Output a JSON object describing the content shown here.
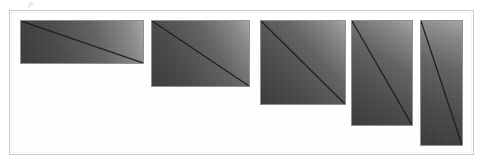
{
  "figure": {
    "background_color": "#ffffff",
    "frame": {
      "border_color": "#c9c9c9",
      "inner_border_color": "#f2f2f2",
      "x": 9,
      "y": 10,
      "width": 465,
      "height": 145
    },
    "artifact": {
      "name": "scan-speck",
      "x": 27,
      "y": 2
    }
  },
  "chart_data": {
    "type": "bar",
    "title": "",
    "subtitle": "",
    "xlabel": "",
    "ylabel": "",
    "grid": false,
    "legend": null,
    "annotations": [],
    "categories": [
      "plate-1",
      "plate-2",
      "plate-3",
      "plate-4",
      "plate-5"
    ],
    "values": [
      44,
      67,
      85,
      106,
      126
    ],
    "series": [
      {
        "name": "width",
        "values": [
          124,
          99,
          86,
          62,
          43
        ]
      },
      {
        "name": "height",
        "values": [
          44,
          67,
          85,
          106,
          126
        ]
      },
      {
        "name": "aspect_ratio_w_over_h",
        "values": [
          2.82,
          1.48,
          1.01,
          0.58,
          0.34
        ]
      }
    ],
    "ylim": [
      0,
      145
    ],
    "xlim": [
      0,
      483
    ]
  },
  "plates": [
    {
      "name": "plate-1",
      "x": 20,
      "y": 20,
      "width": 124,
      "height": 44,
      "gradient_from": "#3a3a3a",
      "gradient_to": "#a8a8a8",
      "border_color": "#8f8f8f",
      "diagonal_color": "#1d1d1d",
      "diagonal_from": "top-left",
      "diagonal_to": "bottom-right"
    },
    {
      "name": "plate-2",
      "x": 151,
      "y": 20,
      "width": 99,
      "height": 67,
      "gradient_from": "#3a3a3a",
      "gradient_to": "#a8a8a8",
      "border_color": "#8f8f8f",
      "diagonal_color": "#1d1d1d",
      "diagonal_from": "top-left",
      "diagonal_to": "bottom-right"
    },
    {
      "name": "plate-3",
      "x": 260,
      "y": 20,
      "width": 86,
      "height": 85,
      "gradient_from": "#3a3a3a",
      "gradient_to": "#a8a8a8",
      "border_color": "#8f8f8f",
      "diagonal_color": "#1d1d1d",
      "diagonal_from": "top-left",
      "diagonal_to": "bottom-right"
    },
    {
      "name": "plate-4",
      "x": 351,
      "y": 20,
      "width": 62,
      "height": 106,
      "gradient_from": "#3a3a3a",
      "gradient_to": "#a8a8a8",
      "border_color": "#8f8f8f",
      "diagonal_color": "#1d1d1d",
      "diagonal_from": "top-left",
      "diagonal_to": "bottom-right"
    },
    {
      "name": "plate-5",
      "x": 420,
      "y": 20,
      "width": 43,
      "height": 126,
      "gradient_from": "#3a3a3a",
      "gradient_to": "#a8a8a8",
      "border_color": "#8f8f8f",
      "diagonal_color": "#1d1d1d",
      "diagonal_from": "top-left",
      "diagonal_to": "bottom-right"
    }
  ]
}
